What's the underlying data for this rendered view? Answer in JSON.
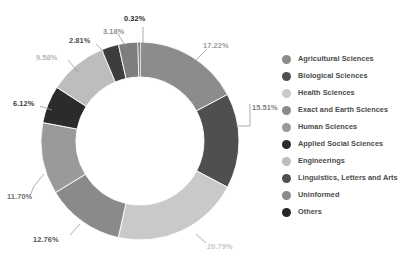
{
  "chart_data": {
    "type": "pie",
    "variant": "donut",
    "title": "",
    "subtitle": "",
    "xlabel": "",
    "ylabel": "",
    "grid": false,
    "legend_position": "right",
    "value_unit": "%",
    "start_angle_deg": 0,
    "direction": "clockwise",
    "categories": [
      "Agricultural Sciences",
      "Biological Sciences",
      "Health Sciences",
      "Exact and Earth Sciences",
      "Human Sciences",
      "Applied Social Sciences",
      "Engineerings",
      "Linguistics, Letters and Arts",
      "Uninformed",
      "Others"
    ],
    "values": [
      17.22,
      15.51,
      20.79,
      12.76,
      11.7,
      6.12,
      9.58,
      2.81,
      3.18,
      0.32
    ],
    "data_labels": [
      "17.22%",
      "15.51%",
      "20.79%",
      "12.76%",
      "11.70%",
      "6.12%",
      "9.58%",
      "2.81%",
      "3.18%",
      "0.32%"
    ],
    "colors": [
      "#8c8c8c",
      "#4f4f4f",
      "#c9c9c9",
      "#8a8a8a",
      "#9a9a9a",
      "#2b2b2b",
      "#bdbdbd",
      "#3d3d3d",
      "#7e7e7e",
      "#1f1f1f"
    ],
    "label_colors": [
      "#9b9b9b",
      "#808080",
      "#c7c7c7",
      "#555555",
      "#6e6e6e",
      "#3a3a3a",
      "#b5b5b5",
      "#4a4a4a",
      "#8f8f8f",
      "#2b2b2b"
    ]
  },
  "legend": {
    "items": [
      {
        "label": "Agricultural Sciences",
        "color": "#8c8c8c"
      },
      {
        "label": "Biological Sciences",
        "color": "#4f4f4f"
      },
      {
        "label": "Health Sciences",
        "color": "#c9c9c9"
      },
      {
        "label": "Exact and Earth Sciences",
        "color": "#8a8a8a"
      },
      {
        "label": "Human Sciences",
        "color": "#9a9a9a"
      },
      {
        "label": "Applied Social Sciences",
        "color": "#2b2b2b"
      },
      {
        "label": "Engineerings",
        "color": "#bdbdbd"
      },
      {
        "label": "Linguistics, Letters and Arts",
        "color": "#4f4f4f"
      },
      {
        "label": "Uninformed",
        "color": "#8a8a8a"
      },
      {
        "label": "Others",
        "color": "#262626"
      }
    ]
  },
  "labels": {
    "p0": "17.22%",
    "p1": "15.51%",
    "p2": "20.79%",
    "p3": "12.76%",
    "p4": "11.70%",
    "p5": "6.12%",
    "p6": "9.58%",
    "p7": "2.81%",
    "p8": "3.18%",
    "p9": "0.32%"
  }
}
